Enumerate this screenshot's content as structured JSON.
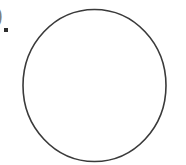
{
  "figure": {
    "type": "geometric-figure",
    "background_color": "#ffffff",
    "width": 186,
    "height": 165,
    "shapes": [
      {
        "name": "circle",
        "kind": "ellipse",
        "center_x": 94.5,
        "center_y": 85.5,
        "radius_x": 71.5,
        "radius_y": 76.0,
        "stroke_color": "#3a3a3a",
        "stroke_width": 1.6,
        "fill": "none"
      }
    ],
    "marks": {
      "period_label": ".",
      "period_color": "#2e2e2e",
      "clipped_glyph": ")",
      "clipped_glyph_color": "#6a6a6a"
    },
    "caption": ""
  }
}
